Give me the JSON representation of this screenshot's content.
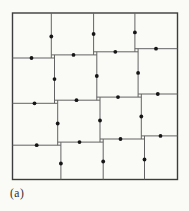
{
  "figure": {
    "caption_label": "(a)",
    "background_color": "#fafaf7",
    "outer_square": {
      "x": 12.5,
      "y": 13,
      "width": 165,
      "height": 166.5
    },
    "style": {
      "outer_stroke_color": "#3c3c3c",
      "outer_stroke_width": 1.4,
      "inner_stroke_color": "#636363",
      "inner_stroke_width": 1,
      "dot_color": "#161616",
      "dot_radius": 1.9,
      "label_color": "#2e2e2e"
    },
    "inner_edges": [
      {
        "x1": 51.3,
        "y1": 13,
        "x2": 51.3,
        "y2": 58.0
      },
      {
        "x1": 54.5,
        "y1": 54.9,
        "x2": 54.5,
        "y2": 103.3
      },
      {
        "x1": 57.7,
        "y1": 100.2,
        "x2": 57.7,
        "y2": 145.2
      },
      {
        "x1": 60.9,
        "y1": 142.1,
        "x2": 60.9,
        "y2": 179.5
      },
      {
        "x1": 93.6,
        "y1": 13,
        "x2": 93.6,
        "y2": 54.9
      },
      {
        "x1": 96.8,
        "y1": 51.8,
        "x2": 96.8,
        "y2": 100.2
      },
      {
        "x1": 100.0,
        "y1": 97.1,
        "x2": 100.0,
        "y2": 142.1
      },
      {
        "x1": 103.2,
        "y1": 139.0,
        "x2": 103.2,
        "y2": 179.5
      },
      {
        "x1": 134.9,
        "y1": 13,
        "x2": 134.9,
        "y2": 51.8
      },
      {
        "x1": 138.1,
        "y1": 48.7,
        "x2": 138.1,
        "y2": 97.1
      },
      {
        "x1": 141.3,
        "y1": 94.0,
        "x2": 141.3,
        "y2": 139.0
      },
      {
        "x1": 144.5,
        "y1": 135.9,
        "x2": 144.5,
        "y2": 179.5
      },
      {
        "x1": 12.5,
        "y1": 58.0,
        "x2": 54.5,
        "y2": 58.0
      },
      {
        "x1": 51.3,
        "y1": 54.9,
        "x2": 96.8,
        "y2": 54.9
      },
      {
        "x1": 93.6,
        "y1": 51.8,
        "x2": 138.1,
        "y2": 51.8
      },
      {
        "x1": 134.9,
        "y1": 48.7,
        "x2": 177.5,
        "y2": 48.7
      },
      {
        "x1": 12.5,
        "y1": 103.3,
        "x2": 57.7,
        "y2": 103.3
      },
      {
        "x1": 54.5,
        "y1": 100.2,
        "x2": 100.0,
        "y2": 100.2
      },
      {
        "x1": 96.8,
        "y1": 97.1,
        "x2": 141.3,
        "y2": 97.1
      },
      {
        "x1": 138.1,
        "y1": 94.0,
        "x2": 177.5,
        "y2": 94.0
      },
      {
        "x1": 12.5,
        "y1": 145.2,
        "x2": 60.9,
        "y2": 145.2
      },
      {
        "x1": 57.7,
        "y1": 142.1,
        "x2": 103.2,
        "y2": 142.1
      },
      {
        "x1": 100.0,
        "y1": 139.0,
        "x2": 144.5,
        "y2": 139.0
      },
      {
        "x1": 141.3,
        "y1": 135.9,
        "x2": 177.5,
        "y2": 135.9
      }
    ],
    "dots": [
      {
        "x": 51.3,
        "y": 36.5
      },
      {
        "x": 54.5,
        "y": 79.1
      },
      {
        "x": 57.7,
        "y": 123.5
      },
      {
        "x": 60.9,
        "y": 163.5
      },
      {
        "x": 93.6,
        "y": 34.0
      },
      {
        "x": 96.8,
        "y": 76.0
      },
      {
        "x": 100.0,
        "y": 120.5
      },
      {
        "x": 103.2,
        "y": 161.5
      },
      {
        "x": 134.9,
        "y": 32.4
      },
      {
        "x": 138.1,
        "y": 72.9
      },
      {
        "x": 141.3,
        "y": 116.5
      },
      {
        "x": 144.5,
        "y": 159.5
      },
      {
        "x": 31.5,
        "y": 58.0
      },
      {
        "x": 73.5,
        "y": 54.9
      },
      {
        "x": 115.3,
        "y": 51.8
      },
      {
        "x": 156.0,
        "y": 48.7
      },
      {
        "x": 34.5,
        "y": 103.3
      },
      {
        "x": 76.5,
        "y": 100.2
      },
      {
        "x": 118.0,
        "y": 97.1
      },
      {
        "x": 157.8,
        "y": 94.0
      },
      {
        "x": 36.7,
        "y": 145.2
      },
      {
        "x": 79.5,
        "y": 142.1
      },
      {
        "x": 120.5,
        "y": 139.0
      },
      {
        "x": 160.5,
        "y": 135.9
      }
    ]
  }
}
